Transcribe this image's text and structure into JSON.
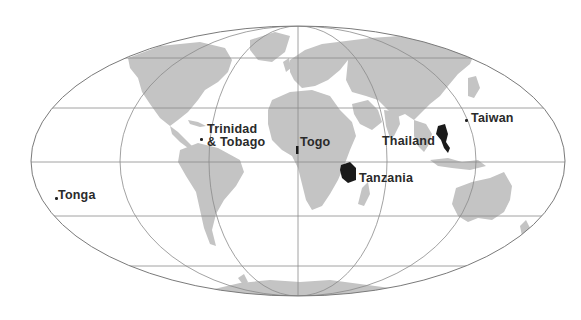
{
  "map": {
    "projection": "mollweide-style world map",
    "colors": {
      "land": "#c4c4c4",
      "highlight": "#1a1a1a",
      "grid": "#8a8a8a",
      "background": "#ffffff",
      "label": "#2a2a2a"
    },
    "labels": [
      {
        "id": "trinidad",
        "line1": "Trinidad",
        "line2": "& Tobago"
      },
      {
        "id": "togo",
        "text": "Togo"
      },
      {
        "id": "thailand",
        "text": "Thailand"
      },
      {
        "id": "taiwan",
        "text": "Taiwan"
      },
      {
        "id": "tanzania",
        "text": "Tanzania"
      },
      {
        "id": "tonga",
        "text": "Tonga"
      }
    ]
  }
}
